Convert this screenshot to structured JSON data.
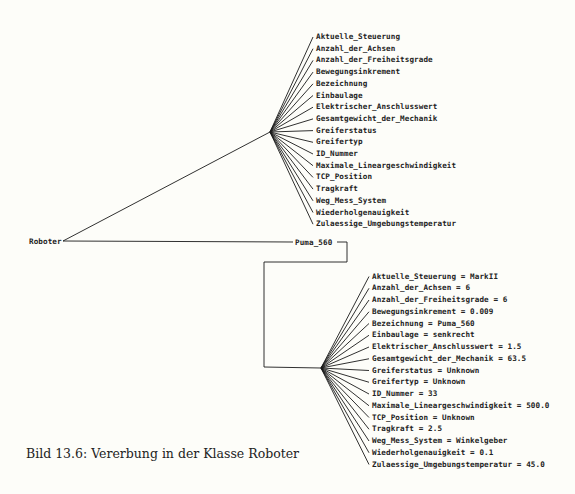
{
  "root": {
    "label": "Roboter"
  },
  "instance": {
    "label": "Puma_560"
  },
  "class_attributes": [
    "Aktuelle_Steuerung",
    "Anzahl_der_Achsen",
    "Anzahl_der_Freiheitsgrade",
    "Bewegungsinkrement",
    "Bezeichnung",
    "Einbaulage",
    "Elektrischer_Anschlusswert",
    "Gesamtgewicht_der_Mechanik",
    "Greiferstatus",
    "Greifertyp",
    "ID_Nummer",
    "Maximale_Lineargeschwindigkeit",
    "TCP_Position",
    "Tragkraft",
    "Weg_Mess_System",
    "Wiederholgenauigkeit",
    "Zulaessige_Umgebungstemperatur"
  ],
  "instance_attributes": [
    "Aktuelle_Steuerung = MarkII",
    "Anzahl_der_Achsen = 6",
    "Anzahl_der_Freiheitsgrade = 6",
    "Bewegungsinkrement = 0.009",
    "Bezeichnung = Puma_560",
    "Einbaulage = senkrecht",
    "Elektrischer_Anschlusswert = 1.5",
    "Gesamtgewicht_der_Mechanik = 63.5",
    "Greiferstatus = Unknown",
    "Greifertyp = Unknown",
    "ID_Nummer = 33",
    "Maximale_Lineargeschwindigkeit = 500.0",
    "TCP_Position = Unknown",
    "Tragkraft = 2.5",
    "Weg_Mess_System = Winkelgeber",
    "Wiederholgenauigkeit = 0.1",
    "Zulaessige_Umgebungstemperatur = 45.0"
  ],
  "caption": "Bild 13.6: Vererbung in der Klasse Roboter",
  "colors": {
    "line": "#1a1a1a",
    "text": "#222222",
    "background": "#fdfdf9"
  }
}
